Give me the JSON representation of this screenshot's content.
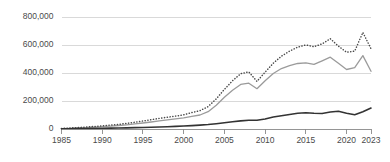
{
  "chart_data": {
    "type": "line",
    "title": "",
    "subtitle": "",
    "xlabel": "",
    "ylabel": "",
    "xlim": [
      1985,
      2023
    ],
    "ylim": [
      0,
      800000
    ],
    "grid": true,
    "legend": "none",
    "y_ticks": [
      0,
      200000,
      400000,
      600000,
      800000
    ],
    "y_tick_labels": [
      "0",
      "200,000",
      "400,000",
      "600,000",
      "800,000"
    ],
    "x_ticks": [
      1985,
      1990,
      1995,
      2000,
      2005,
      2010,
      2015,
      2020,
      2023
    ],
    "x_tick_labels": [
      "1985",
      "1990",
      "1995",
      "2000",
      "2005",
      "2010",
      "2015",
      "2020",
      "2023"
    ],
    "x": [
      1985,
      1986,
      1987,
      1988,
      1989,
      1990,
      1991,
      1992,
      1993,
      1994,
      1995,
      1996,
      1997,
      1998,
      1999,
      2000,
      2001,
      2002,
      2003,
      2004,
      2005,
      2006,
      2007,
      2008,
      2009,
      2010,
      2011,
      2012,
      2013,
      2014,
      2015,
      2016,
      2017,
      2018,
      2019,
      2020,
      2021,
      2022,
      2023
    ],
    "series": [
      {
        "name": "dotted-upper-series",
        "style": "dotted",
        "color": "#4a4a4a",
        "values": [
          4000,
          7000,
          10000,
          14000,
          18000,
          23000,
          28000,
          33000,
          40000,
          48000,
          57000,
          66000,
          76000,
          84000,
          92000,
          101000,
          117000,
          131000,
          160000,
          215000,
          283000,
          345000,
          395000,
          408000,
          340000,
          406000,
          470000,
          520000,
          556000,
          585000,
          600000,
          588000,
          608000,
          645000,
          592000,
          548000,
          556000,
          690000,
          573000
        ]
      },
      {
        "name": "gray-middle-series",
        "style": "solid",
        "color": "#9b9b9b",
        "values": [
          2500,
          4500,
          7000,
          10000,
          13000,
          17000,
          21000,
          25000,
          30000,
          36000,
          43000,
          50000,
          58000,
          65000,
          72000,
          80000,
          90000,
          100000,
          124000,
          170000,
          227000,
          277000,
          318000,
          327000,
          288000,
          345000,
          396000,
          432000,
          452000,
          468000,
          472000,
          462000,
          487000,
          513000,
          470000,
          425000,
          438000,
          524000,
          412000
        ]
      },
      {
        "name": "dark-lower-series",
        "style": "solid",
        "color": "#333333",
        "values": [
          1500,
          2000,
          2800,
          3500,
          4200,
          5000,
          6000,
          7000,
          8000,
          9500,
          11000,
          12500,
          14500,
          16500,
          18500,
          21000,
          24000,
          27500,
          32000,
          38000,
          45000,
          52000,
          58000,
          63000,
          62000,
          72000,
          86000,
          95000,
          103000,
          112000,
          116000,
          112000,
          111000,
          121000,
          127000,
          112000,
          102000,
          123000,
          150000
        ]
      }
    ]
  },
  "axis": {
    "y_axis_name": "value-axis",
    "x_axis_name": "year-axis"
  }
}
